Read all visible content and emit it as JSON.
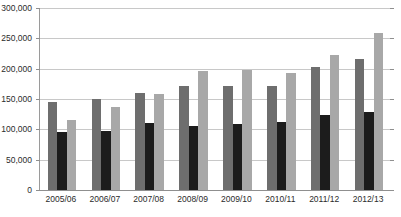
{
  "chart_data": {
    "type": "bar",
    "title": "",
    "xlabel": "",
    "ylabel": "",
    "grid": true,
    "legend_position": "none",
    "ylim": [
      0,
      300000
    ],
    "ytick_interval": 50000,
    "ytick_labels": [
      "0",
      "50,000",
      "100,000",
      "150,000",
      "200,000",
      "250,000",
      "300,000"
    ],
    "ytick_values": [
      0,
      50000,
      100000,
      150000,
      200000,
      250000,
      300000
    ],
    "categories": [
      "2005/06",
      "2006/07",
      "2007/08",
      "2008/09",
      "2009/10",
      "2010/11",
      "2011/12",
      "2012/13"
    ],
    "series": [
      {
        "name": "series-1",
        "color": "#6e6e6e",
        "values": [
          145000,
          150000,
          160000,
          172000,
          172000,
          172000,
          202000,
          216000
        ]
      },
      {
        "name": "series-2",
        "color": "#1c1c1c",
        "values": [
          95000,
          98000,
          110000,
          105000,
          108000,
          112000,
          124000,
          128000
        ]
      },
      {
        "name": "series-3",
        "color": "#a8a8a8",
        "values": [
          115000,
          137000,
          158000,
          196000,
          198000,
          193000,
          222000,
          259000
        ]
      }
    ]
  },
  "axes": {
    "axis_line_color": "#8f8f8f",
    "gridline_color": "#c8c8c8"
  }
}
